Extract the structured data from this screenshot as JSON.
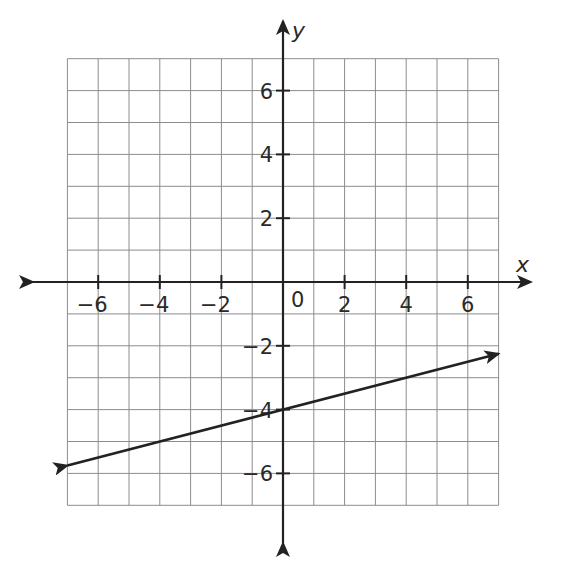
{
  "chart_data": {
    "type": "line",
    "title": "",
    "xlabel": "x",
    "ylabel": "y",
    "xlim": [
      -7,
      7
    ],
    "ylim": [
      -7,
      7
    ],
    "grid": true,
    "grid_step": 1,
    "x_ticks": [
      -6,
      -4,
      -2,
      2,
      4,
      6
    ],
    "x_tick_labels": [
      "−6",
      "−4",
      "−2",
      "2",
      "4",
      "6"
    ],
    "y_ticks": [
      -6,
      -4,
      -2,
      2,
      4,
      6
    ],
    "y_tick_labels": [
      "−6",
      "−4",
      "−2",
      "2",
      "4",
      "6"
    ],
    "origin_label": "0",
    "series": [
      {
        "name": "line",
        "equation": "y = 0.25x - 4",
        "slope": 0.25,
        "intercept": -4,
        "x": [
          -7,
          7
        ],
        "y": [
          -5.75,
          -2.25
        ],
        "arrows": "both"
      }
    ],
    "colors": {
      "grid": "#8c8c8c",
      "axis": "#222222",
      "line": "#222222"
    }
  }
}
